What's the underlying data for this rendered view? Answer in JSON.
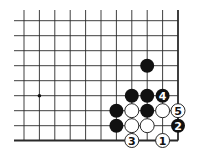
{
  "diagram": {
    "type": "go-board-corner",
    "colors": {
      "line": "#2a2a2a",
      "black_stone": "#111111",
      "white_stone": "#ffffff",
      "background": "#ffffff"
    },
    "grid": {
      "columns": 11,
      "rows": 9,
      "col_x": [
        24,
        39.4,
        54.8,
        70.2,
        85.6,
        101,
        116.4,
        131.8,
        147.2,
        162.6,
        178
      ],
      "row_y": [
        20.7,
        35.7,
        50.7,
        65.7,
        80.7,
        95.7,
        110.7,
        125.7,
        140.5
      ],
      "line_start_x": 14,
      "line_start_y": 10,
      "right_edge_col": 10,
      "bottom_edge_row": 8
    },
    "star_points": [
      {
        "col": 1,
        "row": 5
      }
    ],
    "stones": [
      {
        "color": "black",
        "col": 8,
        "row": 3,
        "label": ""
      },
      {
        "color": "black",
        "col": 7,
        "row": 5,
        "label": ""
      },
      {
        "color": "black",
        "col": 8,
        "row": 5,
        "label": ""
      },
      {
        "color": "black",
        "col": 9,
        "row": 5,
        "label": "4"
      },
      {
        "color": "black",
        "col": 6,
        "row": 6,
        "label": ""
      },
      {
        "color": "white",
        "col": 7,
        "row": 6,
        "label": ""
      },
      {
        "color": "black",
        "col": 8,
        "row": 6,
        "label": ""
      },
      {
        "color": "white",
        "col": 9,
        "row": 6,
        "label": ""
      },
      {
        "color": "white",
        "col": 10,
        "row": 6,
        "label": "5"
      },
      {
        "color": "black",
        "col": 6,
        "row": 7,
        "label": ""
      },
      {
        "color": "white",
        "col": 7,
        "row": 7,
        "label": ""
      },
      {
        "color": "white",
        "col": 8,
        "row": 7,
        "label": ""
      },
      {
        "color": "black",
        "col": 10,
        "row": 7,
        "label": "2"
      },
      {
        "color": "white",
        "col": 7,
        "row": 8,
        "label": "3"
      },
      {
        "color": "white",
        "col": 9,
        "row": 8,
        "label": "1"
      }
    ]
  }
}
